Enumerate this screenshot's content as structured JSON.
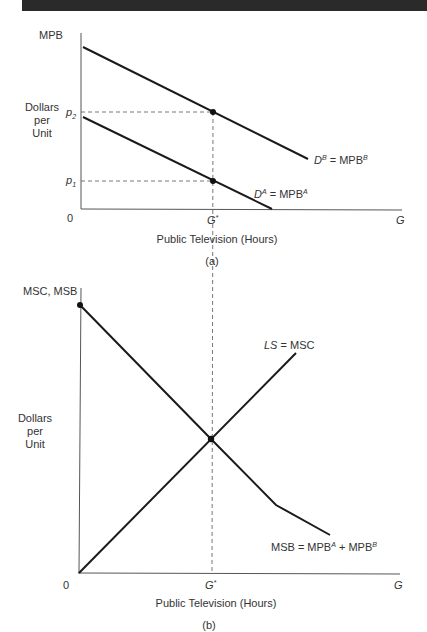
{
  "panel_a": {
    "y_axis_label": "MPB",
    "y_side_label_line1": "Dollars",
    "y_side_label_line2": "per",
    "y_side_label_line3": "Unit",
    "origin": "0",
    "x_end_label": "G",
    "x_tick_label": "G",
    "x_tick_sup": "*",
    "x_axis_title": "Public Television (Hours)",
    "caption": "(a)",
    "p2_label": "p",
    "p2_sub": "2",
    "p1_label": "p",
    "p1_sub": "1",
    "curve_b_label_d": "D",
    "curve_b_label_sup": "B",
    "curve_b_label_eq": " = MPB",
    "curve_b_label_sup2": "B",
    "curve_a_label_d": "D",
    "curve_a_label_sup": "A",
    "curve_a_label_eq": " = MPB",
    "curve_a_label_sup2": "A"
  },
  "panel_b": {
    "y_axis_label": "MSC, MSB",
    "y_side_label_line1": "Dollars",
    "y_side_label_line2": "per",
    "y_side_label_line3": "Unit",
    "origin": "0",
    "x_end_label": "G",
    "x_tick_label": "G",
    "x_tick_sup": "*",
    "x_axis_title": "Public Television (Hours)",
    "caption": "(b)",
    "supply_label_ls": "LS",
    "supply_label_eq": " = MSC",
    "msb_label_main": "MSB = MPB",
    "msb_label_sup1": "A",
    "msb_label_plus": " + MPB",
    "msb_label_sup2": "B"
  },
  "colors": {
    "line": "#1a1a1a",
    "axis": "#555555",
    "dashed": "#555555",
    "text": "#333333",
    "header_bar": "#2a2a2a"
  }
}
